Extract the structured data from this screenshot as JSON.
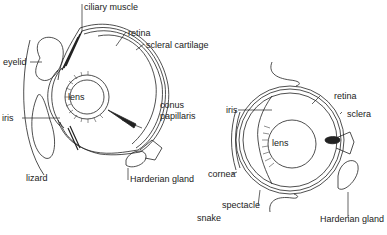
{
  "diagram": {
    "type": "anatomical-comparison",
    "subjects": [
      "lizard",
      "snake"
    ]
  },
  "lizard": {
    "caption": "lizard",
    "labels": {
      "ciliary_muscle": "ciliary muscle",
      "retina": "retina",
      "scleral_cartilage": "scleral cartilage",
      "eyelid": "eyelid",
      "lens": "lens",
      "iris": "iris",
      "conus_line1": "conus",
      "conus_line2": "papillaris",
      "harderian_gland": "Harderian gland"
    }
  },
  "snake": {
    "caption": "snake",
    "labels": {
      "retina": "retina",
      "iris": "iris",
      "sclera": "sclera",
      "lens": "lens",
      "cornea": "cornea",
      "spectacle": "spectacle",
      "harderian_gland": "Harderian gland"
    }
  },
  "colors": {
    "line": "#222222",
    "background": "#ffffff"
  }
}
